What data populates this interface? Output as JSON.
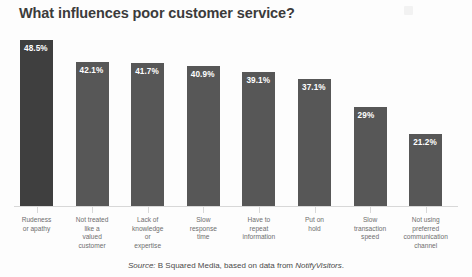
{
  "title": "What influences poor customer service?",
  "source": {
    "prefix": "Source:",
    "body": " B Squared Media, based on data from ",
    "attribution": "NotifyVisitors",
    "suffix": "."
  },
  "colors": {
    "primary_bar": "#3f3f3f",
    "bar": "#575757",
    "title_text": "#3b3b3b",
    "label_text": "#6e6e6e",
    "value_text": "#ffffff",
    "axis": "#d8d8d8",
    "background": "#fdfdfd"
  },
  "chart_data": {
    "type": "bar",
    "title": "What influences poor customer service?",
    "xlabel": "",
    "ylabel": "",
    "ylim": [
      0,
      55
    ],
    "grid": false,
    "legend": false,
    "orientation": "vertical",
    "value_label_position": "inside-top-left",
    "categories": [
      "Rudeness or apathy",
      "Not treated like a valued customer",
      "Lack of knowledge or expertise",
      "Slow response time",
      "Have to repeat information",
      "Put on hold",
      "Slow transaction speed",
      "Not using preferred communication channel"
    ],
    "category_lines": [
      [
        "Rudeness",
        "or apathy"
      ],
      [
        "Not treated",
        "like a",
        "valued",
        "customer"
      ],
      [
        "Lack of",
        "knowledge",
        "or",
        "expertise"
      ],
      [
        "Slow",
        "response",
        "time"
      ],
      [
        "Have to",
        "repeat",
        "information"
      ],
      [
        "Put on",
        "hold"
      ],
      [
        "Slow",
        "transaction",
        "speed"
      ],
      [
        "Not using",
        "preferred",
        "communication",
        "channel"
      ]
    ],
    "values": [
      48.5,
      42.1,
      41.7,
      40.9,
      39.1,
      37.1,
      29,
      21.2
    ],
    "value_labels": [
      "48.5%",
      "42.1%",
      "41.7%",
      "40.9%",
      "39.1%",
      "37.1%",
      "29%",
      "21.2%"
    ],
    "series": [
      {
        "name": "Share of respondents",
        "values": [
          48.5,
          42.1,
          41.7,
          40.9,
          39.1,
          37.1,
          29,
          21.2
        ]
      }
    ]
  }
}
